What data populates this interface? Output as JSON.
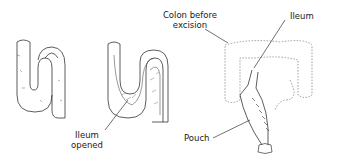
{
  "diagram": {
    "type": "surgical-illustration",
    "panels": [
      {
        "id": "ileum-loop",
        "description": "S-shaped loop of ileum"
      },
      {
        "id": "ileum-opened",
        "description": "Ileum loop opened lengthwise"
      },
      {
        "id": "pouch-formation",
        "description": "Ileal pouch placed where colon was excised"
      }
    ],
    "labels": {
      "ileum_opened_line1": "Ileum",
      "ileum_opened_line2": "opened",
      "colon_line1": "Colon before",
      "colon_line2": "excision",
      "ileum": "Ileum",
      "pouch": "Pouch"
    },
    "colors": {
      "ink": "#333333",
      "dotted": "#777777",
      "background": "#ffffff"
    }
  }
}
